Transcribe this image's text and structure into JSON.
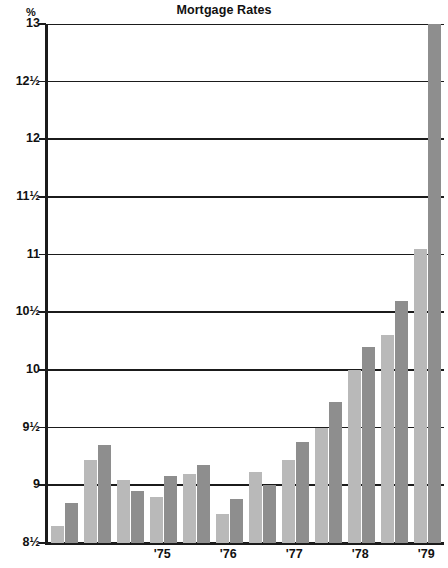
{
  "chart_data": {
    "type": "bar",
    "title": "Mortgage Rates",
    "xlabel": "",
    "ylabel": "%",
    "ylim": [
      8.5,
      13
    ],
    "grid": true,
    "legend": false,
    "y_unit_label": "%",
    "y_ticks": [
      {
        "value": 13,
        "label": "13"
      },
      {
        "value": 12.5,
        "label": "12½"
      },
      {
        "value": 12,
        "label": "12"
      },
      {
        "value": 11.5,
        "label": "11½"
      },
      {
        "value": 11,
        "label": "11"
      },
      {
        "value": 10.5,
        "label": "10½"
      },
      {
        "value": 10,
        "label": "10"
      },
      {
        "value": 9.5,
        "label": "9½"
      },
      {
        "value": 9,
        "label": "9"
      },
      {
        "value": 8.5,
        "label": "8½"
      }
    ],
    "x_ticks": [
      {
        "label": "'75",
        "index": 6
      },
      {
        "label": "'76",
        "index": 10
      },
      {
        "label": "'77",
        "index": 14
      },
      {
        "label": "'78",
        "index": 18
      },
      {
        "label": "'79",
        "index": 22
      }
    ],
    "bar_colors": {
      "light": "#b9b9b9",
      "dark": "#8e8e8e"
    },
    "categories": [
      "1974 Q1",
      "1974 Q2",
      "1974 Q3",
      "1974 Q4",
      "1975 Q1",
      "1975 Q2",
      "1975 Q3",
      "1975 Q4",
      "1976 Q1",
      "1976 Q2",
      "1976 Q3",
      "1976 Q4",
      "1977 Q1",
      "1977 Q2",
      "1977 Q3",
      "1977 Q4",
      "1978 Q1",
      "1978 Q2",
      "1978 Q3",
      "1978 Q4",
      "1979 Q1",
      "1979 Q2",
      "1979 Q3",
      "1979 Q4"
    ],
    "values": [
      8.65,
      8.85,
      9.22,
      9.35,
      9.05,
      8.95,
      8.9,
      9.08,
      9.1,
      9.18,
      8.75,
      8.88,
      9.12,
      9.0,
      9.22,
      9.38,
      9.5,
      9.72,
      10.0,
      10.2,
      10.3,
      10.6,
      11.05,
      13.0
    ],
    "shades": [
      "light",
      "dark",
      "light",
      "dark",
      "light",
      "dark",
      "light",
      "dark",
      "light",
      "dark",
      "light",
      "dark",
      "light",
      "dark",
      "light",
      "dark",
      "light",
      "dark",
      "light",
      "dark",
      "light",
      "dark",
      "light",
      "dark"
    ]
  }
}
